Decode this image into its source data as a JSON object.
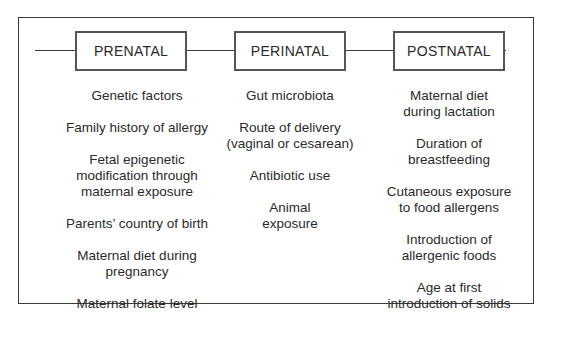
{
  "diagram": {
    "type": "timeline",
    "phases": [
      {
        "label": "PRENATAL",
        "items": [
          "Genetic factors",
          "Family history of allergy",
          "Fetal epigenetic\nmodification through\nmaternal exposure",
          "Parents’ country of birth",
          "Maternal diet during\npregnancy",
          "Maternal folate level"
        ]
      },
      {
        "label": "PERINATAL",
        "items": [
          "Gut microbiota",
          "Route of delivery\n(vaginal or cesarean)",
          "Antibiotic use",
          "Animal\nexposure"
        ]
      },
      {
        "label": "POSTNATAL",
        "items": [
          "Maternal diet\nduring lactation",
          "Duration of\nbreastfeeding",
          "Cutaneous exposure\nto food allergens",
          "Introduction of\nallergenic foods",
          "Age at first\nintroduction of solids"
        ]
      }
    ]
  },
  "colors": {
    "line": "#3a3a3a",
    "box_border": "#555555",
    "text": "#2a2a2a",
    "background": "#ffffff"
  }
}
